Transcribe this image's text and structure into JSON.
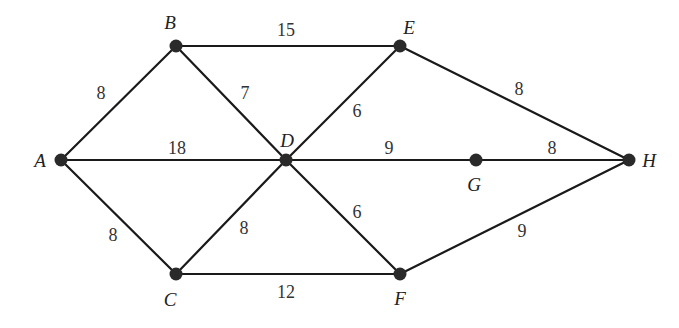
{
  "graph": {
    "type": "weighted-undirected-graph",
    "nodes": [
      {
        "id": "A",
        "label": "A",
        "x": 61,
        "y": 160,
        "lx": 40,
        "ly": 167
      },
      {
        "id": "B",
        "label": "B",
        "x": 176,
        "y": 46,
        "lx": 170,
        "ly": 29
      },
      {
        "id": "C",
        "label": "C",
        "x": 176,
        "y": 274,
        "lx": 170,
        "ly": 306
      },
      {
        "id": "D",
        "label": "D",
        "x": 286,
        "y": 160,
        "lx": 287,
        "ly": 147
      },
      {
        "id": "E",
        "label": "E",
        "x": 400,
        "y": 46,
        "lx": 409,
        "ly": 34
      },
      {
        "id": "F",
        "label": "F",
        "x": 400,
        "y": 274,
        "lx": 400,
        "ly": 305
      },
      {
        "id": "G",
        "label": "G",
        "x": 476,
        "y": 160,
        "lx": 474,
        "ly": 191
      },
      {
        "id": "H",
        "label": "H",
        "x": 629,
        "y": 160,
        "lx": 649,
        "ly": 167
      }
    ],
    "edges": [
      {
        "from": "A",
        "to": "B",
        "weight": "8",
        "wx": 101,
        "wy": 99
      },
      {
        "from": "B",
        "to": "E",
        "weight": "15",
        "wx": 286,
        "wy": 36
      },
      {
        "from": "B",
        "to": "D",
        "weight": "7",
        "wx": 245,
        "wy": 99
      },
      {
        "from": "A",
        "to": "D",
        "weight": "18",
        "wx": 177,
        "wy": 154
      },
      {
        "from": "D",
        "to": "E",
        "weight": "6",
        "wx": 357,
        "wy": 117
      },
      {
        "from": "D",
        "to": "G",
        "weight": "9",
        "wx": 389,
        "wy": 154
      },
      {
        "from": "G",
        "to": "H",
        "weight": "8",
        "wx": 552,
        "wy": 154
      },
      {
        "from": "E",
        "to": "H",
        "weight": "8",
        "wx": 519,
        "wy": 95
      },
      {
        "from": "A",
        "to": "C",
        "weight": "8",
        "wx": 113,
        "wy": 241
      },
      {
        "from": "C",
        "to": "D",
        "weight": "8",
        "wx": 244,
        "wy": 234
      },
      {
        "from": "D",
        "to": "F",
        "weight": "6",
        "wx": 357,
        "wy": 218
      },
      {
        "from": "C",
        "to": "F",
        "weight": "12",
        "wx": 286,
        "wy": 298
      },
      {
        "from": "F",
        "to": "H",
        "weight": "9",
        "wx": 522,
        "wy": 237
      }
    ],
    "colors": {
      "edge": "#1a1a1a",
      "node": "#2a2a2a",
      "text": "#222222",
      "background": "#ffffff"
    }
  }
}
